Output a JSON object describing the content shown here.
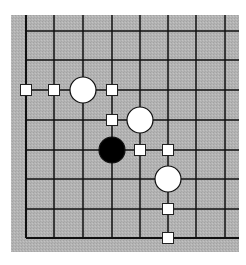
{
  "diagram": {
    "type": "go-board-corner",
    "corner": "bottom-left",
    "board": {
      "left": 11,
      "top": 15,
      "right": 239,
      "bottom": 252,
      "background": "#b3b3b3",
      "line_color": "#111111"
    },
    "grid": {
      "columns_x": [
        26,
        54,
        83,
        112,
        140,
        168,
        196,
        225
      ],
      "rows_y": [
        31,
        60,
        90,
        120,
        150,
        179,
        209,
        238
      ],
      "edge_left_index": 0,
      "edge_bottom_index": 7
    },
    "stones": [
      {
        "color": "white",
        "col": 2,
        "row": 2
      },
      {
        "color": "white",
        "col": 4,
        "row": 3
      },
      {
        "color": "black",
        "col": 3,
        "row": 4
      },
      {
        "color": "white",
        "col": 5,
        "row": 5
      }
    ],
    "markers": [
      {
        "shape": "square",
        "col": 0,
        "row": 2
      },
      {
        "shape": "square",
        "col": 1,
        "row": 2
      },
      {
        "shape": "square",
        "col": 3,
        "row": 2
      },
      {
        "shape": "square",
        "col": 3,
        "row": 3
      },
      {
        "shape": "square",
        "col": 4,
        "row": 4
      },
      {
        "shape": "square",
        "col": 5,
        "row": 4
      },
      {
        "shape": "square",
        "col": 5,
        "row": 6
      },
      {
        "shape": "square",
        "col": 5,
        "row": 7
      }
    ],
    "colors": {
      "white_stone_fill": "#ffffff",
      "black_stone_fill": "#000000",
      "stone_outline": "#111111",
      "marker_fill": "#ffffff",
      "marker_outline": "#222222"
    }
  }
}
